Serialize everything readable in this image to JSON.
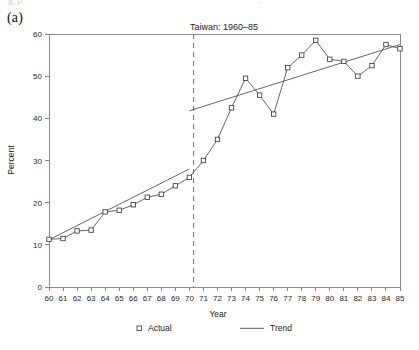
{
  "panel": {
    "label": "(a)"
  },
  "ghost_top_text": {
    "left": "g  p",
    "right": "."
  },
  "chart_data": {
    "type": "line",
    "title": "Taiwan: 1960–85",
    "subtitle": "",
    "xlabel": "Year",
    "ylabel": "Percent",
    "grid": false,
    "legend_position": "bottom",
    "xlim": [
      60,
      85
    ],
    "ylim": [
      0,
      60
    ],
    "xticks": [
      60,
      61,
      62,
      63,
      64,
      65,
      66,
      67,
      68,
      69,
      70,
      71,
      72,
      73,
      74,
      75,
      76,
      77,
      78,
      79,
      80,
      81,
      82,
      83,
      84,
      85
    ],
    "xticklabels": [
      "60",
      "61",
      "62",
      "63",
      "64",
      "65",
      "66",
      "67",
      "68",
      "69",
      "70",
      "71",
      "72",
      "73",
      "74",
      "75",
      "76",
      "77",
      "78",
      "79",
      "80",
      "81",
      "82",
      "83",
      "84",
      "85"
    ],
    "yticks": [
      0,
      10,
      20,
      30,
      40,
      50,
      60
    ],
    "yticklabels": [
      "0",
      "10",
      "20",
      "30",
      "40",
      "50",
      "60"
    ],
    "x": [
      60,
      61,
      62,
      63,
      64,
      65,
      66,
      67,
      68,
      69,
      70,
      71,
      72,
      73,
      74,
      75,
      76,
      77,
      78,
      79,
      80,
      81,
      82,
      83,
      84,
      85
    ],
    "series": [
      {
        "name": "Actual",
        "marker": "open-square",
        "values": [
          11.3,
          11.5,
          13.3,
          13.5,
          17.8,
          18.2,
          19.5,
          21.3,
          22.0,
          24.0,
          26.0,
          30.0,
          35.0,
          42.5,
          49.5,
          45.5,
          41.0,
          52.0,
          55.0,
          58.5,
          54.0,
          53.5,
          50.0,
          52.5,
          57.5,
          56.5
        ]
      },
      {
        "name": "Trend",
        "marker": "none",
        "note": "piecewise linear, broken at the structural break",
        "segments": [
          {
            "x": [
              60,
              70
            ],
            "y": [
              11.2,
              28.0
            ]
          },
          {
            "x": [
              70,
              85
            ],
            "y": [
              41.8,
              57.5
            ]
          }
        ]
      }
    ],
    "annotations": [
      {
        "type": "vertical-dashed-line",
        "x": 70.3,
        "label": "structural break"
      }
    ]
  },
  "legend": {
    "entries": [
      {
        "label": "Actual",
        "symbol": "open-square"
      },
      {
        "label": "Trend",
        "symbol": "line-segment"
      }
    ]
  }
}
